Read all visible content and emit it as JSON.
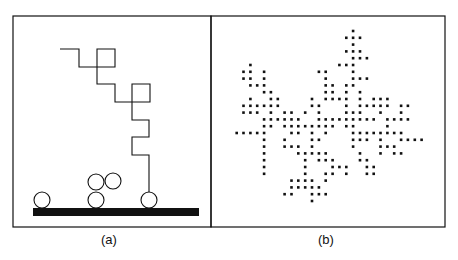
{
  "figure": {
    "panels": [
      {
        "id": "a",
        "caption": "(a)",
        "frame": {
          "x": 13,
          "y": 16,
          "w": 198,
          "h": 211
        },
        "walk_path": [
          [
            60,
            49
          ],
          [
            79,
            49
          ],
          [
            79,
            67
          ],
          [
            115,
            67
          ],
          [
            115,
            49
          ],
          [
            97,
            49
          ],
          [
            97,
            84
          ],
          [
            115,
            84
          ],
          [
            115,
            102
          ],
          [
            150,
            102
          ],
          [
            150,
            84
          ],
          [
            132,
            84
          ],
          [
            132,
            120
          ],
          [
            149,
            120
          ],
          [
            149,
            137
          ],
          [
            132,
            137
          ],
          [
            132,
            155
          ],
          [
            149,
            155
          ],
          [
            149,
            192
          ]
        ],
        "particles": [
          {
            "cx": 42,
            "cy": 200,
            "r": 8
          },
          {
            "cx": 96,
            "cy": 182,
            "r": 8
          },
          {
            "cx": 113,
            "cy": 181,
            "r": 8
          },
          {
            "cx": 96,
            "cy": 200,
            "r": 8
          },
          {
            "cx": 149,
            "cy": 200,
            "r": 8
          }
        ],
        "substrate": {
          "x": 33,
          "y": 208,
          "w": 166,
          "h": 8
        }
      },
      {
        "id": "b",
        "caption": "(b)",
        "frame": {
          "x": 211,
          "y": 16,
          "w": 234,
          "h": 211
        },
        "lattice": {
          "x0": 236.7,
          "dx": 6.85,
          "y0": 31,
          "dy": 6.8,
          "dot": 2.6
        },
        "rows": [
          [
            17
          ],
          [
            16,
            17,
            18
          ],
          [
            17
          ],
          [
            16,
            17,
            18
          ],
          [
            17,
            18,
            19
          ],
          [
            2,
            15,
            16,
            17
          ],
          [
            1,
            2,
            4,
            12,
            13,
            17
          ],
          [
            1,
            2,
            4,
            13,
            17,
            18,
            19
          ],
          [
            2,
            3,
            4,
            13,
            14,
            16,
            17
          ],
          [
            4,
            5,
            13,
            14,
            16,
            18
          ],
          [
            2,
            5,
            6,
            11,
            13,
            14,
            15,
            16,
            18,
            20,
            21,
            22
          ],
          [
            1,
            2,
            3,
            4,
            5,
            6,
            11,
            12,
            16,
            18,
            19,
            20,
            21,
            22,
            24,
            25
          ],
          [
            1,
            2,
            3,
            5,
            7,
            8,
            10,
            12,
            16,
            17,
            18,
            21,
            24
          ],
          [
            4,
            5,
            6,
            7,
            8,
            9,
            12,
            13,
            14,
            15,
            16,
            17,
            18,
            19,
            20,
            22,
            23,
            24,
            25
          ],
          [
            4,
            5,
            7,
            8,
            9,
            10,
            11,
            12,
            13,
            14,
            16,
            17,
            22
          ],
          [
            0,
            1,
            2,
            3,
            4,
            8,
            9,
            11,
            13,
            17,
            18,
            19,
            20,
            21,
            22,
            23,
            24
          ],
          [
            4,
            7,
            11,
            12,
            17,
            18,
            19,
            21,
            24,
            25,
            26,
            27
          ],
          [
            4,
            7,
            8,
            9,
            11,
            17,
            21,
            22,
            23
          ],
          [
            4,
            9,
            10,
            11,
            12,
            13,
            18,
            21,
            23,
            24
          ],
          [
            4,
            10,
            12,
            13,
            14,
            18,
            19
          ],
          [
            4,
            10,
            14,
            15,
            16,
            19,
            20
          ],
          [
            4,
            10,
            13,
            14,
            16,
            19,
            20
          ],
          [
            8,
            9,
            10,
            11,
            13
          ],
          [
            8,
            9,
            10,
            11,
            12
          ],
          [
            7,
            8,
            11,
            12,
            13
          ],
          [
            11
          ]
        ]
      }
    ],
    "colors": {
      "ink": "#111111",
      "background": "#ffffff"
    }
  }
}
